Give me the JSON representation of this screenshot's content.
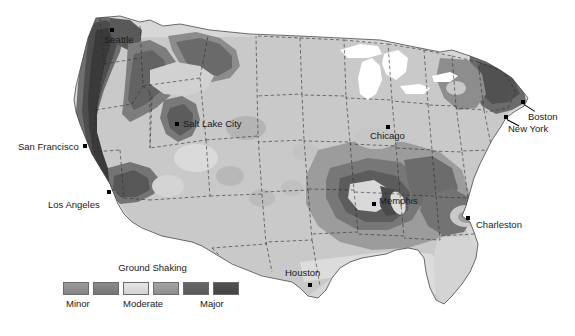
{
  "figure": {
    "type": "seismic-hazard-map",
    "region": "Contiguous United States",
    "background_color": "#ffffff"
  },
  "legend": {
    "title": "Ground Shaking",
    "swatch_colors": [
      "#8f8f8f",
      "#808080",
      "#dcdcdc",
      "#9a9a9a",
      "#606060",
      "#4a4a4a"
    ],
    "labels": [
      {
        "text": "Minor",
        "left": 6
      },
      {
        "text": "Moderate",
        "left": 63
      },
      {
        "text": "Major",
        "left": 140
      }
    ]
  },
  "cities": [
    {
      "name": "Seattle",
      "dot_x": 112,
      "dot_y": 30,
      "label_x": 104,
      "label_y": 35,
      "leader": null
    },
    {
      "name": "San Francisco",
      "dot_x": 85,
      "dot_y": 146,
      "label_x": 18,
      "label_y": 142,
      "leader": null
    },
    {
      "name": "Los Angeles",
      "dot_x": 109,
      "dot_y": 192,
      "label_x": 48,
      "label_y": 200,
      "leader": null
    },
    {
      "name": "Salt Lake City",
      "dot_x": 177,
      "dot_y": 124,
      "label_x": 183,
      "label_y": 119,
      "leader": null
    },
    {
      "name": "Chicago",
      "dot_x": 388,
      "dot_y": 127,
      "label_x": 370,
      "label_y": 131,
      "leader": null
    },
    {
      "name": "Memphis",
      "dot_x": 374,
      "dot_y": 204,
      "label_x": 379,
      "label_y": 196,
      "leader": null
    },
    {
      "name": "Charleston",
      "dot_x": 468,
      "dot_y": 218,
      "label_x": 476,
      "label_y": 220,
      "leader": null
    },
    {
      "name": "Houston",
      "dot_x": 310,
      "dot_y": 285,
      "label_x": 285,
      "label_y": 268,
      "leader": null
    },
    {
      "name": "Boston",
      "dot_x": 523,
      "dot_y": 102,
      "label_x": 528,
      "label_y": 112,
      "leader": {
        "x1": 525,
        "y1": 105,
        "x2": 534,
        "y2": 113
      }
    },
    {
      "name": "New York",
      "dot_x": 506,
      "dot_y": 117,
      "label_x": 508,
      "label_y": 124,
      "leader": {
        "x1": 508,
        "y1": 119,
        "x2": 518,
        "y2": 126
      }
    }
  ],
  "hazard_levels": {
    "minor": "#d7d7d7",
    "low": "#c2c2c2",
    "moderate_light": "#ababab",
    "moderate": "#959595",
    "high": "#7a7a7a",
    "major": "#5e5e5e",
    "extreme": "#464646",
    "lake": "#ffffff"
  }
}
